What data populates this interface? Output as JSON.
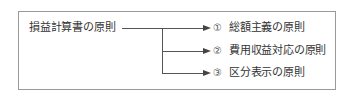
{
  "diagram": {
    "root": "損益計算書の原則",
    "branches": [
      {
        "number": "①",
        "label": "総額主義の原則"
      },
      {
        "number": "②",
        "label": "費用収益対応の原則"
      },
      {
        "number": "③",
        "label": "区分表示の原則"
      }
    ]
  },
  "colors": {
    "border": "#9a9a9a",
    "line": "#555555",
    "text": "#333333"
  }
}
